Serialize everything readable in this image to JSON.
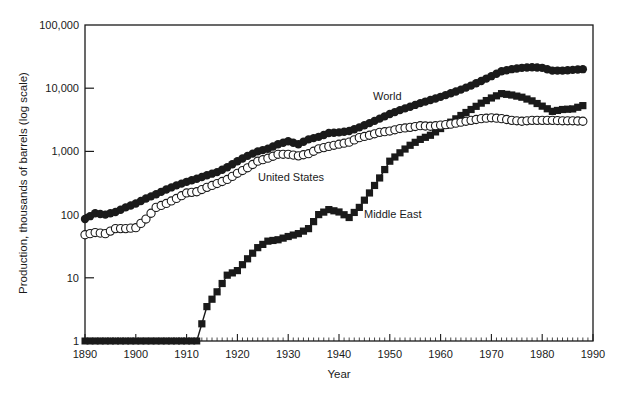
{
  "chart_data": {
    "type": "line",
    "title": "",
    "xlabel": "Year",
    "ylabel": "Production, thousands of barrels (log scale)",
    "y_scale": "log",
    "xlim": [
      1890,
      1990
    ],
    "ylim": [
      1,
      100000
    ],
    "x_ticks": [
      1890,
      1900,
      1910,
      1920,
      1930,
      1940,
      1950,
      1960,
      1970,
      1980,
      1990
    ],
    "y_ticks": [
      {
        "value": 1,
        "label": "1"
      },
      {
        "value": 10,
        "label": "10"
      },
      {
        "value": 100,
        "label": "100"
      },
      {
        "value": 1000,
        "label": "1,000"
      },
      {
        "value": 10000,
        "label": "10,000"
      },
      {
        "value": 100000,
        "label": "100,000"
      }
    ],
    "grid": false,
    "legend": "inline labels",
    "x": [
      1890,
      1892,
      1894,
      1896,
      1898,
      1900,
      1902,
      1904,
      1906,
      1908,
      1910,
      1912,
      1914,
      1916,
      1918,
      1920,
      1922,
      1924,
      1926,
      1928,
      1930,
      1932,
      1934,
      1936,
      1938,
      1940,
      1942,
      1944,
      1946,
      1948,
      1950,
      1952,
      1954,
      1956,
      1958,
      1960,
      1962,
      1964,
      1966,
      1968,
      1970,
      1972,
      1974,
      1976,
      1978,
      1980,
      1982,
      1984,
      1986,
      1988
    ],
    "series": [
      {
        "name": "World",
        "marker": "filled-circle",
        "label_pos": [
          1937,
          1200
        ],
        "values": [
          85,
          105,
          100,
          110,
          130,
          150,
          180,
          210,
          250,
          290,
          330,
          370,
          420,
          470,
          560,
          700,
          850,
          1000,
          1100,
          1300,
          1450,
          1300,
          1550,
          1700,
          1950,
          2000,
          2100,
          2400,
          2800,
          3300,
          3900,
          4500,
          5100,
          5800,
          6500,
          7300,
          8300,
          9500,
          11000,
          13000,
          15500,
          18500,
          20000,
          21000,
          21500,
          21000,
          19000,
          19000,
          19500,
          20000
        ]
      },
      {
        "name": "United States",
        "marker": "open-circle",
        "label_pos": [
          1924,
          225
        ],
        "values": [
          48,
          52,
          50,
          60,
          60,
          62,
          85,
          130,
          150,
          180,
          220,
          230,
          270,
          310,
          360,
          450,
          550,
          700,
          780,
          900,
          900,
          850,
          920,
          1100,
          1200,
          1300,
          1400,
          1650,
          1800,
          2000,
          2100,
          2300,
          2400,
          2550,
          2500,
          2600,
          2700,
          2900,
          3100,
          3300,
          3400,
          3300,
          3100,
          3000,
          3100,
          3100,
          3100,
          3050,
          3050,
          3000
        ]
      },
      {
        "name": "Middle East",
        "marker": "filled-square",
        "label_pos": [
          1942,
          100
        ],
        "values": [
          1,
          1,
          1,
          1,
          1,
          1,
          1,
          1,
          1,
          1,
          1,
          1,
          3.5,
          6,
          11,
          13,
          20,
          30,
          38,
          40,
          45,
          50,
          60,
          100,
          120,
          110,
          90,
          130,
          220,
          380,
          700,
          950,
          1250,
          1550,
          1800,
          2300,
          2900,
          3700,
          4600,
          5800,
          7000,
          8200,
          7800,
          7200,
          6300,
          5200,
          4300,
          4600,
          4700,
          5300
        ]
      }
    ],
    "annotations": [
      "World",
      "United States",
      "Middle East"
    ]
  },
  "colors": {
    "ink": "#1a1a1a",
    "background": "#ffffff"
  }
}
